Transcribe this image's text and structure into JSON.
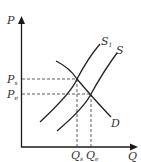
{
  "diagram": {
    "type": "supply-demand",
    "axes": {
      "y_label": "P",
      "x_label": "Q"
    },
    "curves": [
      {
        "id": "S1",
        "label": "S",
        "sub": "1",
        "kind": "supply-shifted"
      },
      {
        "id": "S",
        "label": "S",
        "sub": "",
        "kind": "supply"
      },
      {
        "id": "D",
        "label": "D",
        "sub": "",
        "kind": "demand"
      }
    ],
    "price_levels": [
      {
        "label": "P",
        "sub": "s"
      },
      {
        "label": "P",
        "sub": "e"
      }
    ],
    "quantity_levels": [
      {
        "label": "Q",
        "sub": "s"
      },
      {
        "label": "Q",
        "sub": "e"
      }
    ],
    "colors": {
      "line": "#222222",
      "background": "#ffffff"
    }
  }
}
